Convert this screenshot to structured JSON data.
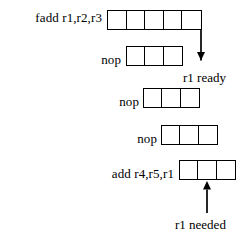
{
  "diagram": {
    "type": "pipeline-timing-diagram",
    "background_color": "#ffffff",
    "line_color": "#000000",
    "rows": [
      {
        "instruction": "fadd r1,r2,r3",
        "stage_count": 5,
        "label_x": 14,
        "label_y": 10,
        "boxes_x": 107,
        "boxes_y": 10,
        "cell_width": 19,
        "cell_height": 20
      },
      {
        "instruction": "nop",
        "stage_count": 3,
        "label_x": 33,
        "label_y": 52,
        "boxes_x": 126,
        "boxes_y": 46,
        "cell_width": 19,
        "cell_height": 20
      },
      {
        "instruction": "nop",
        "stage_count": 3,
        "label_x": 52,
        "label_y": 94,
        "boxes_x": 143,
        "boxes_y": 88,
        "cell_width": 19,
        "cell_height": 20
      },
      {
        "instruction": "nop",
        "stage_count": 3,
        "label_x": 71,
        "label_y": 136,
        "boxes_x": 161,
        "boxes_y": 125,
        "cell_width": 19,
        "cell_height": 20
      },
      {
        "instruction": "add r4,r5,r1",
        "stage_count": 3,
        "label_x": 90,
        "label_y": 166,
        "boxes_x": 179,
        "boxes_y": 160,
        "cell_width": 19,
        "cell_height": 20
      }
    ],
    "annotations": [
      {
        "text": "r1 ready",
        "x": 183,
        "y": 70,
        "arrow": {
          "direction": "down",
          "from_x": 201,
          "from_y": 30,
          "to_x": 201,
          "to_y": 68
        }
      },
      {
        "text": "r1 needed",
        "x": 175,
        "y": 217,
        "arrow": {
          "direction": "up",
          "from_x": 207,
          "from_y": 213,
          "to_x": 207,
          "to_y": 181
        }
      }
    ]
  }
}
